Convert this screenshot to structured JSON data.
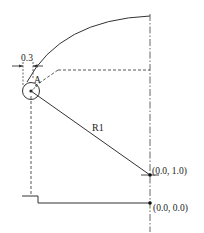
{
  "diagram": {
    "colors": {
      "stroke": "#333333",
      "text": "#222222",
      "background": "#ffffff"
    },
    "labels": {
      "dimension": "0.3",
      "point_a": "A",
      "radius": "R1",
      "point_top": "(0.0, 1.0)",
      "point_origin": "(0.0, 0.0)"
    },
    "elements": [
      {
        "type": "arc",
        "name": "outer-arc"
      },
      {
        "type": "circle",
        "name": "pivot-circle"
      },
      {
        "type": "line",
        "name": "radius-line",
        "label": "R1"
      },
      {
        "type": "dash-dot-line",
        "name": "vertical-centerline"
      },
      {
        "type": "dashed-line",
        "name": "horizontal-guide"
      },
      {
        "type": "dashed-line",
        "name": "vertical-guide"
      },
      {
        "type": "dimension",
        "name": "width-dimension",
        "value": "0.3"
      },
      {
        "type": "polyline",
        "name": "base-step"
      },
      {
        "type": "point",
        "name": "point-0-1",
        "label": "(0.0, 1.0)"
      },
      {
        "type": "point",
        "name": "point-0-0",
        "label": "(0.0, 0.0)"
      }
    ]
  }
}
